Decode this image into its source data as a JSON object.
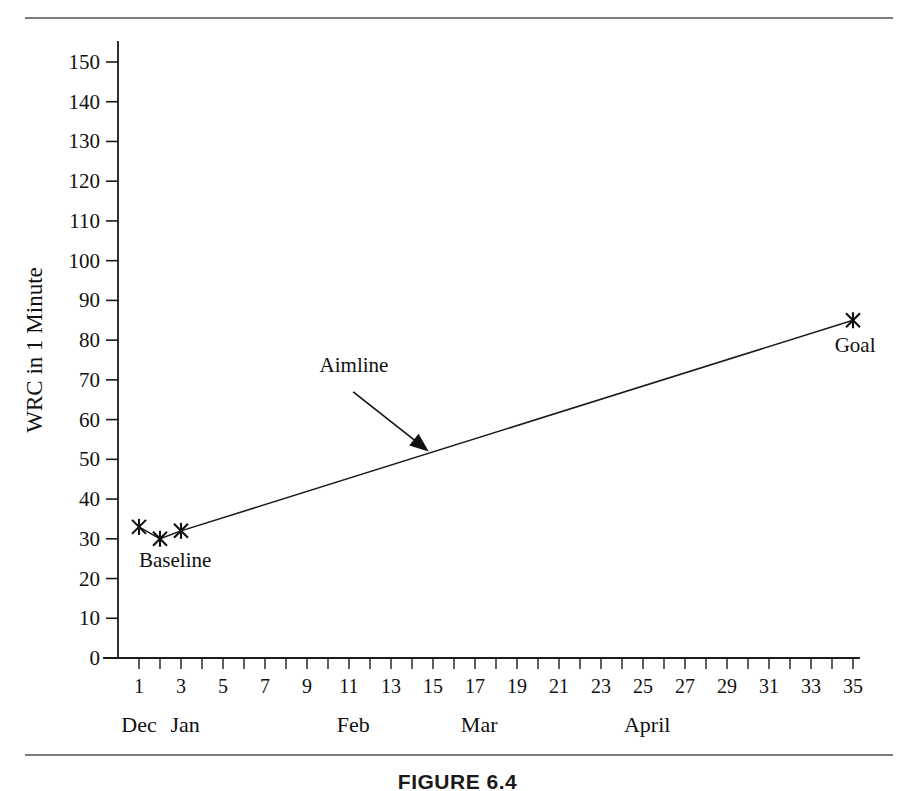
{
  "figure": {
    "caption": "FIGURE 6.4"
  },
  "chart_data": {
    "type": "line",
    "title": "",
    "xlabel": "",
    "ylabel": "WRC in 1 Minute",
    "xlim": [
      0,
      36
    ],
    "ylim": [
      0,
      155
    ],
    "grid": false,
    "legend": "none",
    "y_ticks": [
      0,
      10,
      20,
      30,
      40,
      50,
      60,
      70,
      80,
      90,
      100,
      110,
      120,
      130,
      140,
      150
    ],
    "y_tick_labels": [
      "0",
      "10",
      "20",
      "30",
      "40",
      "50",
      "60",
      "70",
      "80",
      "90",
      "100",
      "110",
      "120",
      "130",
      "140",
      "150"
    ],
    "x_ticks": [
      1,
      2,
      3,
      4,
      5,
      6,
      7,
      8,
      9,
      10,
      11,
      12,
      13,
      14,
      15,
      16,
      17,
      18,
      19,
      20,
      21,
      22,
      23,
      24,
      25,
      26,
      27,
      28,
      29,
      30,
      31,
      32,
      33,
      34,
      35
    ],
    "x_tick_labels": [
      {
        "x": 1,
        "label": "1"
      },
      {
        "x": 3,
        "label": "3"
      },
      {
        "x": 5,
        "label": "5"
      },
      {
        "x": 7,
        "label": "7"
      },
      {
        "x": 9,
        "label": "9"
      },
      {
        "x": 11,
        "label": "11"
      },
      {
        "x": 13,
        "label": "13"
      },
      {
        "x": 15,
        "label": "15"
      },
      {
        "x": 17,
        "label": "17"
      },
      {
        "x": 19,
        "label": "19"
      },
      {
        "x": 21,
        "label": "21"
      },
      {
        "x": 23,
        "label": "23"
      },
      {
        "x": 25,
        "label": "25"
      },
      {
        "x": 27,
        "label": "27"
      },
      {
        "x": 29,
        "label": "29"
      },
      {
        "x": 31,
        "label": "31"
      },
      {
        "x": 33,
        "label": "33"
      },
      {
        "x": 35,
        "label": "35"
      }
    ],
    "month_labels": [
      {
        "x": 1,
        "label": "Dec"
      },
      {
        "x": 3.2,
        "label": "Jan"
      },
      {
        "x": 11.2,
        "label": "Feb"
      },
      {
        "x": 17.2,
        "label": "Mar"
      },
      {
        "x": 25.2,
        "label": "April"
      }
    ],
    "series": [
      {
        "name": "Baseline",
        "marker": "x",
        "points": [
          {
            "x": 1,
            "y": 33
          },
          {
            "x": 2,
            "y": 30
          },
          {
            "x": 3,
            "y": 32
          }
        ]
      },
      {
        "name": "Aimline",
        "marker": "x",
        "points": [
          {
            "x": 3,
            "y": 32
          },
          {
            "x": 35,
            "y": 85
          }
        ]
      }
    ],
    "annotations": [
      {
        "name": "baseline",
        "label": "Baseline",
        "text_x": 1.0,
        "text_y": 23
      },
      {
        "name": "aimline",
        "label": "Aimline",
        "text_x": 9.6,
        "text_y": 72,
        "arrow_from_x": 11.2,
        "arrow_from_y": 67,
        "arrow_to_x": 14.8,
        "arrow_to_y": 52
      },
      {
        "name": "goal",
        "label": "Goal",
        "text_x": 35.1,
        "text_y": 77
      }
    ]
  }
}
